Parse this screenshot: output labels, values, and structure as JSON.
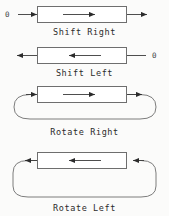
{
  "figure": {
    "background_color": "#fbfbfa",
    "stroke_color": "#3a3a3a",
    "box_fill": "#ffffff",
    "text_color": "#2b2b2b",
    "width": 169,
    "height": 216
  },
  "operations": [
    {
      "id": "shift-right",
      "label": "Shift Right",
      "direction": "right",
      "type": "shift",
      "input_label": "0",
      "input_side": "left",
      "output_side": "right",
      "has_loop": false
    },
    {
      "id": "shift-left",
      "label": "Shift Left",
      "direction": "left",
      "type": "shift",
      "input_label": "0",
      "input_side": "right",
      "output_side": "left",
      "has_loop": false
    },
    {
      "id": "rotate-right",
      "label": "Rotate Right",
      "direction": "right",
      "type": "rotate",
      "input_label": "",
      "input_side": "left",
      "output_side": "right",
      "has_loop": true
    },
    {
      "id": "rotate-left",
      "label": "Rotate Left",
      "direction": "left",
      "type": "rotate",
      "input_label": "",
      "input_side": "right",
      "output_side": "left",
      "has_loop": true
    }
  ]
}
